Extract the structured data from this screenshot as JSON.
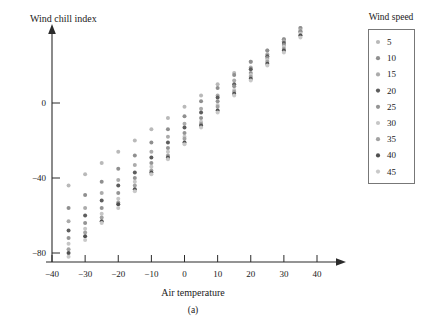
{
  "figure": {
    "caption": "(a)",
    "background": "#ffffff"
  },
  "legend": {
    "title": "Wind speed",
    "position": "right-outside",
    "entries": [
      {
        "label": "5",
        "color": "#b9b9b9"
      },
      {
        "label": "10",
        "color": "#8f8f8f"
      },
      {
        "label": "15",
        "color": "#ababab"
      },
      {
        "label": "20",
        "color": "#5d5d5d"
      },
      {
        "label": "25",
        "color": "#949494"
      },
      {
        "label": "30",
        "color": "#c6c6c6"
      },
      {
        "label": "35",
        "color": "#a2a2a2"
      },
      {
        "label": "40",
        "color": "#4f4f4f"
      },
      {
        "label": "45",
        "color": "#c9c9c9"
      }
    ]
  },
  "chart_data": {
    "type": "scatter",
    "title": "",
    "xlabel": "Air temperature",
    "ylabel": "Wind chill index",
    "xlim": [
      -40,
      47
    ],
    "ylim": [
      -88,
      30
    ],
    "grid": false,
    "xticks": [
      -40,
      -30,
      -20,
      -10,
      0,
      10,
      20,
      30,
      40
    ],
    "xtick_labels": [
      "−40",
      "−30",
      "−20",
      "−10",
      "0",
      "10",
      "20",
      "30",
      "40"
    ],
    "yticks": [
      0,
      -40,
      -80
    ],
    "ytick_labels": [
      "0",
      "−40",
      "−80"
    ],
    "x": [
      -35,
      -30,
      -25,
      -20,
      -15,
      -10,
      -5,
      0,
      5,
      10,
      15,
      20,
      25,
      30,
      35
    ],
    "series": [
      {
        "name": "5",
        "color": "#b9b9b9",
        "values": [
          -44,
          -38,
          -32,
          -26,
          -20,
          -14,
          -8,
          -2,
          4,
          10,
          16,
          22,
          28,
          34,
          40
        ]
      },
      {
        "name": "10",
        "color": "#8f8f8f",
        "values": [
          -56,
          -49,
          -42,
          -35,
          -28,
          -21,
          -14,
          -7,
          1,
          8,
          15,
          22,
          28,
          34,
          40
        ]
      },
      {
        "name": "15",
        "color": "#ababab",
        "values": [
          -63,
          -56,
          -48,
          -41,
          -33,
          -26,
          -18,
          -11,
          -3,
          4,
          12,
          19,
          26,
          33,
          39
        ]
      },
      {
        "name": "20",
        "color": "#5d5d5d",
        "values": [
          -68,
          -60,
          -52,
          -44,
          -37,
          -29,
          -21,
          -13,
          -5,
          3,
          10,
          18,
          25,
          32,
          38
        ]
      },
      {
        "name": "25",
        "color": "#949494",
        "values": [
          -72,
          -64,
          -56,
          -48,
          -40,
          -32,
          -24,
          -16,
          -8,
          1,
          9,
          16,
          24,
          31,
          38
        ]
      },
      {
        "name": "30",
        "color": "#c6c6c6",
        "values": [
          -75,
          -67,
          -59,
          -51,
          -42,
          -34,
          -26,
          -18,
          -10,
          -1,
          7,
          15,
          23,
          30,
          37
        ]
      },
      {
        "name": "35",
        "color": "#a2a2a2",
        "values": [
          -78,
          -69,
          -61,
          -53,
          -44,
          -36,
          -28,
          -19,
          -11,
          -2,
          6,
          14,
          22,
          29,
          36
        ]
      },
      {
        "name": "40",
        "color": "#4f4f4f",
        "values": [
          -80,
          -71,
          -63,
          -54,
          -46,
          -37,
          -29,
          -21,
          -12,
          -4,
          5,
          13,
          21,
          28,
          36
        ]
      },
      {
        "name": "45",
        "color": "#c9c9c9",
        "values": [
          -82,
          -73,
          -64,
          -56,
          -47,
          -38,
          -30,
          -22,
          -13,
          -5,
          4,
          12,
          20,
          27,
          35
        ]
      }
    ]
  },
  "axes": {
    "x_axis_name": "air-temperature-axis",
    "y_axis_name": "wind-chill-index-axis"
  }
}
